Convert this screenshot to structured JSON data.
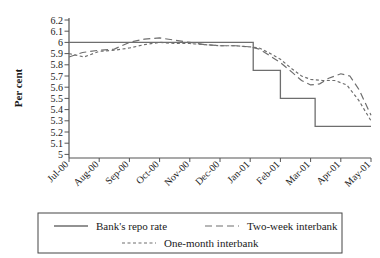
{
  "chart_data": {
    "type": "line",
    "title": "",
    "xlabel": "",
    "ylabel": "Per cent",
    "ylim": [
      5.0,
      6.2
    ],
    "ytick_step": 0.1,
    "yticks": [
      "6.2",
      "6.1",
      "6",
      "5.9",
      "5.8",
      "5.7",
      "5.6",
      "5.5",
      "5.4",
      "5.3",
      "5.2",
      "5.1",
      "5"
    ],
    "grid": false,
    "legend_position": "below",
    "categories": [
      "Jul-00",
      "Aug-00",
      "Sep-00",
      "Oct-00",
      "Nov-00",
      "Dec-00",
      "Jan-01",
      "Feb-01",
      "Mar-01",
      "Apr-01",
      "May-01"
    ],
    "x_range": [
      0,
      10
    ],
    "series": [
      {
        "name": "Bank's repo rate",
        "style": "solid",
        "step": true,
        "values": [
          6.0,
          6.0,
          6.0,
          6.0,
          6.0,
          6.0,
          6.0,
          5.75,
          5.5,
          5.25,
          5.25
        ],
        "step_points": [
          {
            "x": 0.0,
            "y": 6.0
          },
          {
            "x": 6.1,
            "y": 6.0
          },
          {
            "x": 6.1,
            "y": 5.75
          },
          {
            "x": 7.0,
            "y": 5.75
          },
          {
            "x": 7.0,
            "y": 5.5
          },
          {
            "x": 8.15,
            "y": 5.5
          },
          {
            "x": 8.15,
            "y": 5.25
          },
          {
            "x": 10.0,
            "y": 5.25
          }
        ]
      },
      {
        "name": "Two-week interbank",
        "style": "long-dash",
        "values": [
          5.87,
          5.93,
          6.0,
          6.04,
          6.0,
          5.97,
          5.96,
          5.82,
          5.62,
          5.72,
          5.35
        ],
        "points": [
          {
            "x": 0.0,
            "y": 5.87
          },
          {
            "x": 0.45,
            "y": 5.91
          },
          {
            "x": 1.0,
            "y": 5.93
          },
          {
            "x": 1.5,
            "y": 5.94
          },
          {
            "x": 2.0,
            "y": 6.0
          },
          {
            "x": 2.5,
            "y": 6.03
          },
          {
            "x": 3.0,
            "y": 6.04
          },
          {
            "x": 3.5,
            "y": 6.02
          },
          {
            "x": 4.0,
            "y": 6.0
          },
          {
            "x": 4.5,
            "y": 5.98
          },
          {
            "x": 5.0,
            "y": 5.97
          },
          {
            "x": 5.5,
            "y": 5.97
          },
          {
            "x": 6.0,
            "y": 5.96
          },
          {
            "x": 6.3,
            "y": 5.94
          },
          {
            "x": 6.6,
            "y": 5.89
          },
          {
            "x": 7.0,
            "y": 5.82
          },
          {
            "x": 7.4,
            "y": 5.73
          },
          {
            "x": 7.7,
            "y": 5.66
          },
          {
            "x": 8.0,
            "y": 5.62
          },
          {
            "x": 8.3,
            "y": 5.63
          },
          {
            "x": 8.6,
            "y": 5.68
          },
          {
            "x": 9.0,
            "y": 5.72
          },
          {
            "x": 9.3,
            "y": 5.7
          },
          {
            "x": 9.6,
            "y": 5.58
          },
          {
            "x": 10.0,
            "y": 5.35
          }
        ]
      },
      {
        "name": "One-month interbank",
        "style": "short-dash",
        "values": [
          5.9,
          5.92,
          5.95,
          6.0,
          5.99,
          5.97,
          5.96,
          5.85,
          5.67,
          5.66,
          5.3
        ],
        "points": [
          {
            "x": 0.0,
            "y": 5.9
          },
          {
            "x": 0.5,
            "y": 5.87
          },
          {
            "x": 1.0,
            "y": 5.92
          },
          {
            "x": 1.5,
            "y": 5.93
          },
          {
            "x": 2.0,
            "y": 5.95
          },
          {
            "x": 2.5,
            "y": 5.98
          },
          {
            "x": 3.0,
            "y": 6.0
          },
          {
            "x": 3.5,
            "y": 5.99
          },
          {
            "x": 4.0,
            "y": 5.99
          },
          {
            "x": 4.5,
            "y": 5.98
          },
          {
            "x": 5.0,
            "y": 5.97
          },
          {
            "x": 5.5,
            "y": 5.97
          },
          {
            "x": 6.0,
            "y": 5.96
          },
          {
            "x": 6.3,
            "y": 5.95
          },
          {
            "x": 6.6,
            "y": 5.91
          },
          {
            "x": 7.0,
            "y": 5.85
          },
          {
            "x": 7.4,
            "y": 5.76
          },
          {
            "x": 7.7,
            "y": 5.7
          },
          {
            "x": 8.0,
            "y": 5.67
          },
          {
            "x": 8.4,
            "y": 5.66
          },
          {
            "x": 8.8,
            "y": 5.66
          },
          {
            "x": 9.2,
            "y": 5.62
          },
          {
            "x": 9.6,
            "y": 5.48
          },
          {
            "x": 10.0,
            "y": 5.3
          }
        ]
      }
    ]
  },
  "legend": {
    "items": [
      {
        "label": "Bank's repo rate",
        "style": "solid"
      },
      {
        "label": "Two-week interbank",
        "style": "long-dash"
      },
      {
        "label": "One-month interbank",
        "style": "short-dash"
      }
    ]
  },
  "colors": {
    "line": "#6e6e6e",
    "axis": "#555555",
    "text": "#1a1a1a",
    "frame": "#444444",
    "background": "#ffffff"
  }
}
